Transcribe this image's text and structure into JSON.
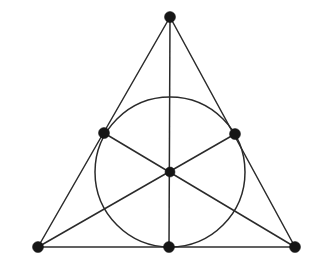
{
  "figure": {
    "background_color": "#ffffff",
    "line_color": "#2b2b2b",
    "dot_color": "#151515",
    "width": 313,
    "height": 263
  },
  "chart_data": {
    "type": "diagram",
    "xlabel": "",
    "ylabel": "",
    "xlim": [
      0,
      313
    ],
    "ylim": [
      0,
      263
    ],
    "grid": false,
    "legend": "none",
    "coordinate_system": "screen-pixels-y-down",
    "points": [
      {
        "id": "A",
        "role": "apex-vertex",
        "x": 170,
        "y": 17,
        "marker": "filled-circle",
        "size": 11
      },
      {
        "id": "B",
        "role": "bottom-left-vertex",
        "x": 38,
        "y": 247,
        "marker": "filled-circle",
        "size": 11
      },
      {
        "id": "C",
        "role": "bottom-right-vertex",
        "x": 295,
        "y": 247,
        "marker": "filled-circle",
        "size": 11
      },
      {
        "id": "Mc",
        "role": "left-side-midpoint",
        "x": 104,
        "y": 133,
        "marker": "filled-circle",
        "size": 11
      },
      {
        "id": "Mb",
        "role": "right-side-midpoint",
        "x": 235,
        "y": 134,
        "marker": "filled-circle",
        "size": 11
      },
      {
        "id": "Ma",
        "role": "base-midpoint",
        "x": 169,
        "y": 247,
        "marker": "filled-circle",
        "size": 11
      },
      {
        "id": "G",
        "role": "centroid",
        "x": 170,
        "y": 172,
        "marker": "filled-circle",
        "size": 10
      }
    ],
    "segments": [
      {
        "id": "side-left",
        "from": "A",
        "to": "B",
        "kind": "triangle-side"
      },
      {
        "id": "side-right",
        "from": "A",
        "to": "C",
        "kind": "triangle-side"
      },
      {
        "id": "side-base",
        "from": "B",
        "to": "C",
        "kind": "triangle-side"
      },
      {
        "id": "median-a",
        "from": "A",
        "to": "Ma",
        "kind": "median"
      },
      {
        "id": "median-b",
        "from": "B",
        "to": "Mb",
        "kind": "median"
      },
      {
        "id": "median-c",
        "from": "C",
        "to": "Mc",
        "kind": "median"
      }
    ],
    "circles": [
      {
        "id": "mid-circle",
        "role": "circle-through-midpoints",
        "cx": 170,
        "cy": 172,
        "r": 75
      }
    ]
  }
}
